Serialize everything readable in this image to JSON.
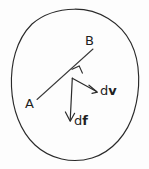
{
  "figure": {
    "type": "physics-vector-diagram",
    "background_color": "#fdfdfd",
    "stroke_color": "#2a2a2a",
    "labels": {
      "point_a": "A",
      "point_b": "B",
      "vector_dv_prefix": "d",
      "vector_dv_symbol": "v",
      "vector_df_prefix": "d",
      "vector_df_symbol": "f"
    },
    "geometry": {
      "ellipse": {
        "cx": 74,
        "cy": 84,
        "rx": 63,
        "ry": 75,
        "rotation_deg": -8
      },
      "chord": {
        "x1": 37,
        "y1": 99,
        "x2": 93,
        "y2": 49
      },
      "junction": {
        "x": 72,
        "y": 78
      },
      "vector_dv": {
        "x1": 72,
        "y1": 78,
        "x2": 97,
        "y2": 92
      },
      "vector_df": {
        "x1": 72,
        "y1": 78,
        "x2": 70,
        "y2": 121
      },
      "right_angle_marker": {
        "x": 74,
        "y": 70,
        "size": 9
      }
    }
  }
}
